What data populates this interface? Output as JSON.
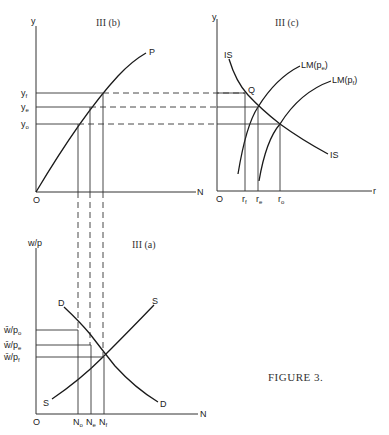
{
  "figure": {
    "caption": "FIGURE 3.",
    "panels": {
      "b": {
        "title": "III (b)",
        "y_axis_label": "y",
        "x_axis_label": "N",
        "origin_label": "O",
        "curve_label": "P",
        "y_levels": [
          {
            "base": "y",
            "sub": "f"
          },
          {
            "base": "y",
            "sub": "e"
          },
          {
            "base": "y",
            "sub": "o"
          }
        ]
      },
      "c": {
        "title": "III (c)",
        "y_axis_label": "y",
        "x_axis_label": "r",
        "origin_label": "O",
        "is_label_top": "IS",
        "is_label_bottom": "IS",
        "point_label": "Q",
        "lm_e": {
          "base": "LM(p",
          "sub": "e",
          "close": ")"
        },
        "lm_f": {
          "base": "LM(p",
          "sub": "f",
          "close": ")"
        },
        "r_levels": [
          {
            "base": "r",
            "sub": "f"
          },
          {
            "base": "r",
            "sub": "e"
          },
          {
            "base": "r",
            "sub": "o"
          }
        ],
        "left_n_label": "N"
      },
      "a": {
        "title": "III (a)",
        "y_axis_label": "w/p",
        "x_axis_label": "N",
        "origin_label": "O",
        "demand_label_top": "D",
        "demand_label_bottom": "D",
        "supply_label_top": "S",
        "supply_label_bottom": "S",
        "wage_levels": [
          {
            "base": "w̄/p",
            "sub": "o"
          },
          {
            "base": "w̄/p",
            "sub": "e"
          },
          {
            "base": "w̄/p",
            "sub": "f"
          }
        ],
        "n_levels": [
          {
            "base": "N",
            "sub": "o"
          },
          {
            "base": "N",
            "sub": "e"
          },
          {
            "base": "N",
            "sub": "f"
          }
        ]
      }
    }
  }
}
